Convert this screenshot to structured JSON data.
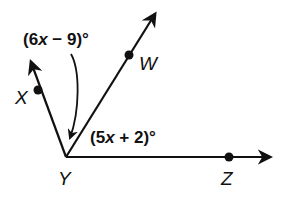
{
  "diagram": {
    "vertex": {
      "label": "Y",
      "x": 66,
      "y": 157
    },
    "points": [
      {
        "label": "X",
        "x": 38,
        "y": 90,
        "ray_end": [
          31,
          62
        ]
      },
      {
        "label": "W",
        "x": 129,
        "y": 55,
        "ray_end": [
          155,
          14
        ]
      },
      {
        "label": "Z",
        "x": 229,
        "y": 157,
        "ray_end": [
          270,
          157
        ]
      }
    ],
    "angles": [
      {
        "name": "angle-XYW",
        "expression": "(6x − 9)°",
        "parts": [
          "(6",
          "x",
          " − 9)°"
        ]
      },
      {
        "name": "angle-WYZ",
        "expression": "(5x + 2)°",
        "parts": [
          "(5",
          "x",
          " + 2)°"
        ]
      }
    ],
    "colors": {
      "stroke": "#111111",
      "background": "#ffffff"
    }
  }
}
